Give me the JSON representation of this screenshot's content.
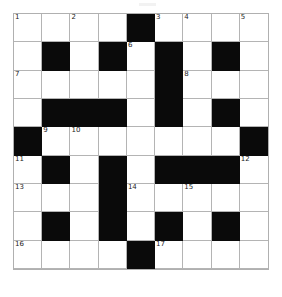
{
  "puzzle": {
    "type": "crossword-grid",
    "title": "",
    "rows": 9,
    "columns": 9,
    "colors": {
      "block": "#0a0a0a",
      "open": "#ffffff",
      "gridline": "#b4b4b4",
      "number_text": "#1c1c1c"
    },
    "legend": {
      "0": "open cell",
      "1": "blocked cell"
    },
    "grid": [
      [
        0,
        0,
        0,
        0,
        1,
        0,
        0,
        0,
        0
      ],
      [
        0,
        1,
        0,
        1,
        0,
        1,
        0,
        1,
        0
      ],
      [
        0,
        0,
        0,
        0,
        0,
        1,
        0,
        0,
        0
      ],
      [
        0,
        1,
        1,
        1,
        0,
        1,
        0,
        1,
        0
      ],
      [
        1,
        0,
        0,
        0,
        0,
        0,
        0,
        0,
        1
      ],
      [
        0,
        1,
        0,
        1,
        0,
        1,
        1,
        1,
        0
      ],
      [
        0,
        0,
        0,
        1,
        0,
        0,
        0,
        0,
        0
      ],
      [
        0,
        1,
        0,
        1,
        0,
        1,
        0,
        1,
        0
      ],
      [
        0,
        0,
        0,
        0,
        1,
        0,
        0,
        0,
        0
      ]
    ],
    "numbers": [
      {
        "number": "1",
        "row": 0,
        "col": 0
      },
      {
        "number": "2",
        "row": 0,
        "col": 2
      },
      {
        "number": "3",
        "row": 0,
        "col": 5
      },
      {
        "number": "4",
        "row": 0,
        "col": 6
      },
      {
        "number": "5",
        "row": 0,
        "col": 8
      },
      {
        "number": "6",
        "row": 1,
        "col": 4
      },
      {
        "number": "7",
        "row": 2,
        "col": 0
      },
      {
        "number": "8",
        "row": 2,
        "col": 6
      },
      {
        "number": "9",
        "row": 4,
        "col": 1
      },
      {
        "number": "10",
        "row": 4,
        "col": 2
      },
      {
        "number": "11",
        "row": 5,
        "col": 0
      },
      {
        "number": "12",
        "row": 5,
        "col": 8
      },
      {
        "number": "13",
        "row": 6,
        "col": 0
      },
      {
        "number": "14",
        "row": 6,
        "col": 4
      },
      {
        "number": "15",
        "row": 6,
        "col": 6
      },
      {
        "number": "16",
        "row": 8,
        "col": 0
      },
      {
        "number": "17",
        "row": 8,
        "col": 5
      }
    ],
    "entries": []
  }
}
